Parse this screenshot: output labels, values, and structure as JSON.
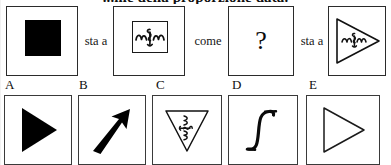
{
  "document": {
    "title": "...me della proporzione data.",
    "language": "it"
  },
  "stem": {
    "relation_1": "sta a",
    "relation_2": "come",
    "relation_3": "sta a",
    "panels": [
      {
        "id": "stem-1",
        "figure": "filled-black-square",
        "label": ""
      },
      {
        "id": "stem-2",
        "figure": "squiggle-in-square",
        "label": ""
      },
      {
        "id": "stem-3",
        "figure": "question-mark",
        "label": "?"
      },
      {
        "id": "stem-4",
        "figure": "squiggle-in-right-triangle",
        "label": ""
      }
    ]
  },
  "options": {
    "letters": [
      "A",
      "B",
      "C",
      "D",
      "E"
    ],
    "items": [
      {
        "letter": "A",
        "figure": "filled-right-triangle"
      },
      {
        "letter": "B",
        "figure": "thick-up-right-arrow"
      },
      {
        "letter": "C",
        "figure": "squiggle-in-down-triangle"
      },
      {
        "letter": "D",
        "figure": "integral-s-curve"
      },
      {
        "letter": "E",
        "figure": "outline-right-triangle"
      }
    ]
  },
  "colors": {
    "ink": "#000000",
    "paper": "#ffffff",
    "rule": "#2b2b2b"
  }
}
